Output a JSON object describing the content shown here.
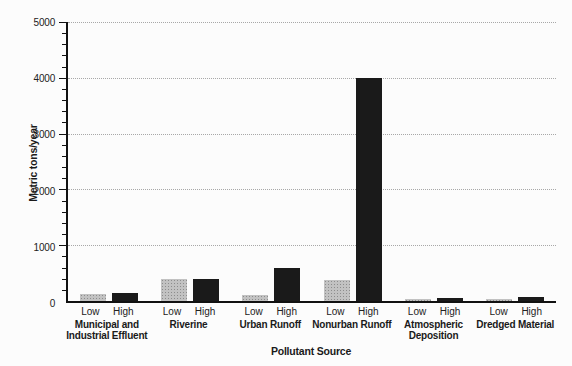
{
  "figure": {
    "y_axis_title": "Metric tons/year",
    "x_axis_title": "Pollutant Source"
  },
  "chart_data": {
    "type": "bar",
    "title": "",
    "xlabel": "Pollutant Source",
    "ylabel": "Metric tons/year",
    "ylim": [
      0,
      5000
    ],
    "yticks": [
      0,
      1000,
      2000,
      3000,
      4000,
      5000
    ],
    "minor_tick_step": 200,
    "grid": "horizontal dotted lines at major ticks",
    "legend_position": "none (Low/High sublabels under each bar pair)",
    "categories": [
      "Municipal and\nIndustrial Effluent",
      "Riverine",
      "Urban Runoff",
      "Nonurban Runoff",
      "Atmospheric\nDeposition",
      "Dredged Material"
    ],
    "bar_sublabels": [
      "Low",
      "High"
    ],
    "series": [
      {
        "name": "Low",
        "color": "#c2c2c2",
        "texture": "halftone-dots",
        "values": [
          130,
          400,
          100,
          380,
          40,
          40
        ]
      },
      {
        "name": "High",
        "color": "#1a1a1a",
        "texture": "solid",
        "values": [
          150,
          400,
          600,
          4000,
          50,
          70
        ]
      }
    ]
  },
  "colors": {
    "axis": "#111111",
    "grid": "#a8a8a8",
    "background": "#fcfcfc",
    "low_bar": "#c2c2c2",
    "high_bar": "#1a1a1a"
  }
}
